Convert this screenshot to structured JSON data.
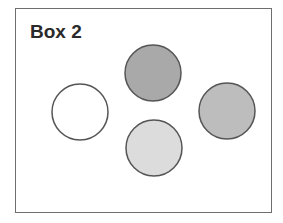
{
  "diagram": {
    "title": "Box 2",
    "circles": [
      {
        "id": "top",
        "cx": 153,
        "cy": 73,
        "r": 28,
        "fill": "#a9a9a9"
      },
      {
        "id": "left",
        "cx": 80,
        "cy": 112,
        "r": 28,
        "fill": "#ffffff"
      },
      {
        "id": "right",
        "cx": 227,
        "cy": 111,
        "r": 28,
        "fill": "#bdbdbd"
      },
      {
        "id": "bottom",
        "cx": 154,
        "cy": 148,
        "r": 28,
        "fill": "#dcdcdc"
      }
    ],
    "stroke": "#555555"
  }
}
